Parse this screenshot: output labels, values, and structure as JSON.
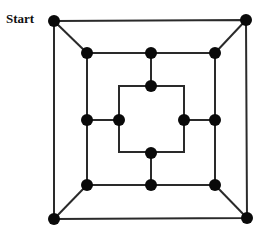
{
  "diagram": {
    "start_label": "Start",
    "line_color": "#2a2a2a",
    "node_color": "#0a0a0a",
    "node_radius": 6,
    "squares": [
      {
        "name": "outer",
        "corners": [
          [
            54,
            21
          ],
          [
            246,
            20
          ],
          [
            247,
            218
          ],
          [
            54,
            219
          ]
        ]
      },
      {
        "name": "middle",
        "corners": [
          [
            87,
            53
          ],
          [
            215,
            53
          ],
          [
            215,
            185
          ],
          [
            87,
            185
          ]
        ]
      },
      {
        "name": "inner",
        "corners": [
          [
            119,
            86
          ],
          [
            184,
            86
          ],
          [
            184,
            152
          ],
          [
            119,
            152
          ]
        ]
      }
    ],
    "edges": [
      [
        [
          54,
          21
        ],
        [
          87,
          53
        ]
      ],
      [
        [
          246,
          20
        ],
        [
          215,
          53
        ]
      ],
      [
        [
          247,
          218
        ],
        [
          215,
          185
        ]
      ],
      [
        [
          54,
          219
        ],
        [
          87,
          185
        ]
      ],
      [
        [
          151,
          53
        ],
        [
          151,
          86
        ]
      ],
      [
        [
          87,
          120
        ],
        [
          119,
          120
        ]
      ],
      [
        [
          215,
          120
        ],
        [
          184,
          120
        ]
      ],
      [
        [
          151,
          185
        ],
        [
          151,
          153
        ]
      ]
    ],
    "nodes": [
      [
        54,
        21
      ],
      [
        246,
        20
      ],
      [
        247,
        218
      ],
      [
        54,
        219
      ],
      [
        87,
        53
      ],
      [
        151,
        53
      ],
      [
        215,
        53
      ],
      [
        87,
        120
      ],
      [
        215,
        120
      ],
      [
        87,
        185
      ],
      [
        151,
        185
      ],
      [
        215,
        185
      ],
      [
        151,
        86
      ],
      [
        119,
        120
      ],
      [
        184,
        120
      ],
      [
        151,
        153
      ]
    ]
  }
}
